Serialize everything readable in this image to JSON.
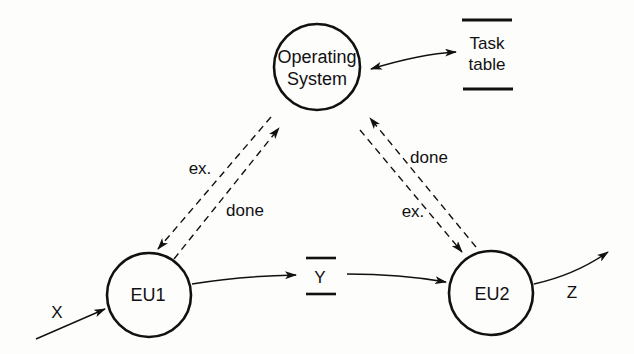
{
  "diagram": {
    "nodes": {
      "os": {
        "line1": "Operating",
        "line2": "System"
      },
      "eu1": {
        "label": "EU1"
      },
      "eu2": {
        "label": "EU2"
      }
    },
    "stores": {
      "task_table": {
        "line1": "Task",
        "line2": "table"
      },
      "y": {
        "label": "Y"
      }
    },
    "edges": {
      "x_input": "X",
      "z_output": "Z",
      "os_to_eu1": "ex.",
      "eu1_to_os": "done",
      "eu2_to_os": "done",
      "os_to_eu2": "ex."
    },
    "colors": {
      "ink": "#111111",
      "background": "#fdfdfc"
    }
  }
}
